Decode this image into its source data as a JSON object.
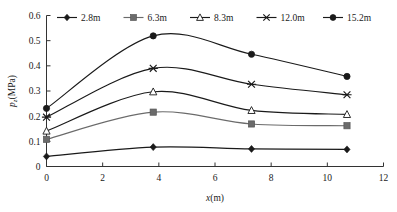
{
  "chart_data": {
    "type": "line",
    "title": "",
    "xlabel": "x(m)",
    "ylabel": "p_z(MPa)",
    "ylabel_base": "p",
    "ylabel_sub": "z",
    "ylabel_unit": "(MPa)",
    "xlim": [
      0,
      12
    ],
    "ylim": [
      0,
      0.6
    ],
    "x_ticks": [
      0,
      2,
      4,
      6,
      8,
      10,
      12
    ],
    "x_tick_labels": [
      "0",
      "2",
      "4",
      "6",
      "8",
      "10",
      "12"
    ],
    "y_ticks": [
      0,
      0.1,
      0.2,
      0.3,
      0.4,
      0.5,
      0.6
    ],
    "y_tick_labels": [
      "0",
      "0.1",
      "0.2",
      "0.3",
      "0.4",
      "0.5",
      "0.6"
    ],
    "grid": false,
    "legend_position": "top",
    "x": [
      0,
      3.8,
      7.3,
      10.7
    ],
    "series": [
      {
        "name": "2.8m",
        "marker": "diamond",
        "color": "#1a1a1a",
        "values": [
          0.04,
          0.077,
          0.07,
          0.068
        ]
      },
      {
        "name": "6.3m",
        "marker": "square",
        "color": "#6b6b6b",
        "values": [
          0.108,
          0.216,
          0.169,
          0.162
        ]
      },
      {
        "name": "8.3m",
        "marker": "triangle-open",
        "color": "#1a1a1a",
        "values": [
          0.141,
          0.297,
          0.223,
          0.207
        ]
      },
      {
        "name": "12.0m",
        "marker": "x-bar",
        "color": "#1a1a1a",
        "values": [
          0.196,
          0.39,
          0.327,
          0.285
        ]
      },
      {
        "name": "15.2m",
        "marker": "circle",
        "color": "#1a1a1a",
        "values": [
          0.231,
          0.519,
          0.446,
          0.358
        ]
      }
    ]
  }
}
